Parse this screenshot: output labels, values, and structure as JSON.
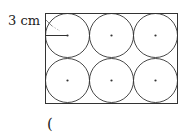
{
  "diagram": {
    "radius_label": "3 cm",
    "answer_bracket": "(",
    "rows": 2,
    "cols": 3,
    "circle_count": 6,
    "stroke_color": "#333333"
  }
}
